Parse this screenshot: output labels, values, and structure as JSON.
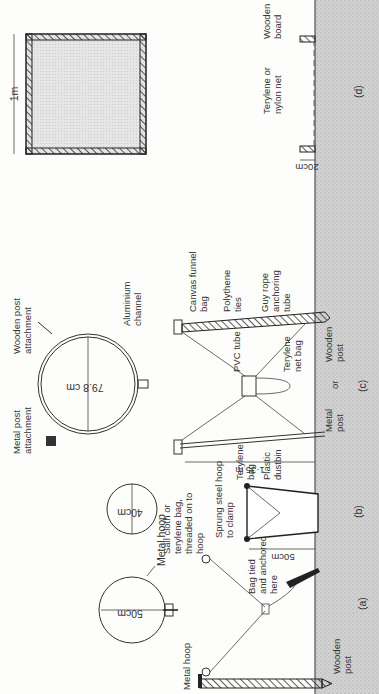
{
  "diagram": {
    "orientation": "rotated 90 degrees counter-clockwise",
    "ground_color": "#c9c9c9",
    "line_color": "#333333",
    "panels": [
      {
        "id": "a",
        "caption": "(a)",
        "labels": {
          "hoop_diameter": "50cm",
          "metal_hoop_plan": "Metal hoop",
          "metal_hoop_side": "Metal hoop",
          "sail_cloth_1": "Sail cloth or",
          "sail_cloth_2": "terylene bag,",
          "sail_cloth_3": "threaded on to",
          "sail_cloth_4": "hoop",
          "bag_tied_1": "Bag tied",
          "bag_tied_2": "and anchored",
          "bag_tied_3": "here",
          "wooden_post_1": "Wooden",
          "wooden_post_2": "post"
        }
      },
      {
        "id": "b",
        "caption": "(b)",
        "labels": {
          "hoop_diameter": "40cm",
          "sprung_1": "Sprung steel hoop",
          "sprung_2": "to clamp",
          "terylene_1": "Terylene",
          "terylene_2": "bag",
          "plastic_1": "Plastic",
          "plastic_2": "dustbin",
          "height": "50cm"
        }
      },
      {
        "id": "c",
        "caption": "(c)",
        "labels": {
          "ring_diameter": "79.8 cm",
          "metal_attach_1": "Metal post",
          "metal_attach_2": "attachment",
          "wooden_attach_1": "Wooden post",
          "wooden_attach_2": "attachment",
          "aluminium_1": "Aluminium",
          "aluminium_2": "channel",
          "canvas_1": "Canvas funnel",
          "canvas_2": "bag",
          "polythene_1": "Polythene",
          "polythene_2": "ties",
          "guy_1": "Guy rope",
          "guy_2": "anchoring",
          "guy_3": "tube",
          "pvc": "PVC tube",
          "net_bag_1": "Terylene",
          "net_bag_2": "net bag",
          "height": "1·35 m",
          "metal_post_1": "Metal",
          "metal_post_2": "post",
          "or": "or",
          "wooden_post_1": "Wooden",
          "wooden_post_2": "post"
        }
      },
      {
        "id": "d",
        "caption": "(d)",
        "labels": {
          "width": "1m",
          "net_1": "Terylene or",
          "net_2": "nylon net",
          "board_1": "Wooden",
          "board_2": "board",
          "height": "20cm"
        }
      }
    ]
  }
}
